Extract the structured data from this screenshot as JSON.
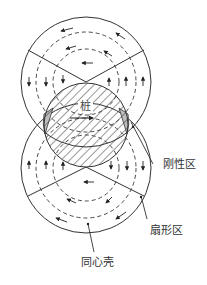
{
  "diagram": {
    "pile_label": "桩",
    "labels": {
      "rigid_zone": "刚性区",
      "fan_zone": "扇形区",
      "concentric_shell": "同心壳"
    },
    "colors": {
      "line": "#333333",
      "rigid_fill": "#bdbdbd",
      "hatch": "#333333",
      "background": "#ffffff"
    }
  }
}
